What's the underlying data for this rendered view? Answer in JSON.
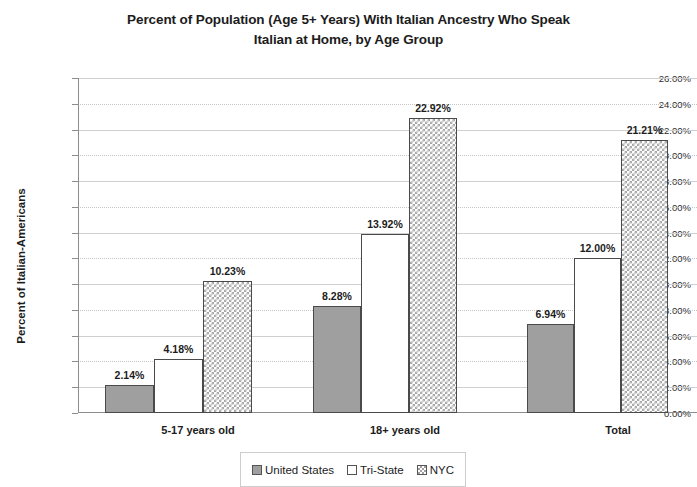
{
  "chart_data": {
    "type": "bar",
    "title": "Percent of Population (Age 5+ Years) With Italian Ancestry Who Speak Italian at Home, by Age Group",
    "title_lines": [
      "Percent of Population (Age 5+ Years) With Italian Ancestry Who Speak",
      "Italian at Home, by Age Group"
    ],
    "xlabel": "",
    "ylabel": "Percent of Italian-Americans",
    "ylim": [
      0,
      26
    ],
    "ytick_labels": [
      "26.00%",
      "24.00%",
      "22.00%",
      "20.00%",
      "18.00%",
      "16.00%",
      "14.00%",
      "12.00%",
      "10.00%",
      "8.00%",
      "6.00%",
      "4.00%",
      "2.00%",
      "0.00%"
    ],
    "ytick_values": [
      26,
      24,
      22,
      20,
      18,
      16,
      14,
      12,
      10,
      8,
      6,
      4,
      2,
      0
    ],
    "grid": true,
    "legend_position": "bottom",
    "categories": [
      "5-17 years old",
      "18+ years old",
      "Total"
    ],
    "series": [
      {
        "name": "United States",
        "values": [
          2.14,
          8.28,
          6.94
        ],
        "labels": [
          "2.14%",
          "8.28%",
          "6.94%"
        ],
        "color": "#9f9f9f",
        "pattern": "solid-gray"
      },
      {
        "name": "Tri-State",
        "values": [
          4.18,
          13.92,
          12.0
        ],
        "labels": [
          "4.18%",
          "13.92%",
          "12.00%"
        ],
        "color": "#ffffff",
        "pattern": "white"
      },
      {
        "name": "NYC",
        "values": [
          10.23,
          22.92,
          21.21
        ],
        "labels": [
          "10.23%",
          "22.92%",
          "21.21%"
        ],
        "color": "#ffffff",
        "pattern": "cross-hatch"
      }
    ]
  }
}
